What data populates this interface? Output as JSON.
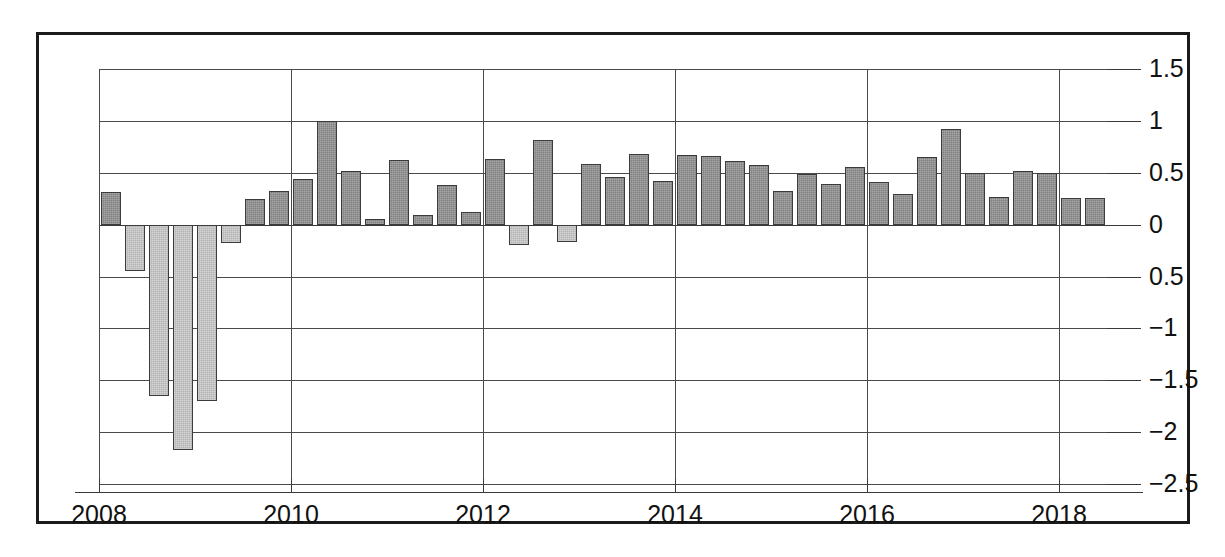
{
  "chart_data": {
    "type": "bar",
    "title": "",
    "subtitle": "",
    "xlabel": "",
    "ylabel": "",
    "grid": true,
    "legend": null,
    "ylim": [
      -2.5,
      1.5
    ],
    "ytick_labels": [
      "1.5",
      "1",
      "0.5",
      "0",
      "0.5",
      "−1",
      "−1.5",
      "−2",
      "−2.5"
    ],
    "ytick_values": [
      1.5,
      1.0,
      0.5,
      0.0,
      -0.5,
      -1.0,
      -1.5,
      -2.0,
      -2.5
    ],
    "xtick_labels": [
      "2008",
      "2010",
      "2012",
      "2014",
      "2016",
      "2018"
    ],
    "xtick_values": [
      2008,
      2010,
      2012,
      2014,
      2016,
      2018
    ],
    "xlim": [
      2008,
      2018.5
    ],
    "bar_colors": {
      "positive": "#808080",
      "negative": "#b5b5b5",
      "outline": "#3b3b3b"
    },
    "frame_color": "#1b1b1b",
    "grid_color": "#4a4a4a",
    "background": "#ffffff",
    "x": [
      2008.0,
      2008.25,
      2008.5,
      2008.75,
      2009.0,
      2009.25,
      2009.5,
      2009.75,
      2010.0,
      2010.25,
      2010.5,
      2010.75,
      2011.0,
      2011.25,
      2011.5,
      2011.75,
      2012.0,
      2012.25,
      2012.5,
      2012.75,
      2013.0,
      2013.25,
      2013.5,
      2013.75,
      2014.0,
      2014.25,
      2014.5,
      2014.75,
      2015.0,
      2015.25,
      2015.5,
      2015.75,
      2016.0,
      2016.25,
      2016.5,
      2016.75,
      2017.0,
      2017.25,
      2017.5,
      2017.75,
      2018.0,
      2018.25
    ],
    "values": [
      0.31,
      -0.45,
      -1.65,
      -2.17,
      -1.7,
      -0.18,
      0.25,
      0.32,
      0.44,
      1.0,
      0.52,
      0.05,
      0.62,
      0.09,
      0.38,
      0.12,
      0.63,
      -0.2,
      0.82,
      -0.17,
      0.58,
      0.46,
      0.68,
      0.42,
      0.67,
      0.66,
      0.61,
      0.57,
      0.32,
      0.49,
      0.39,
      0.56,
      0.41,
      0.3,
      0.65,
      0.92,
      0.5,
      0.27,
      0.52,
      0.5,
      0.26,
      0.26
    ]
  }
}
